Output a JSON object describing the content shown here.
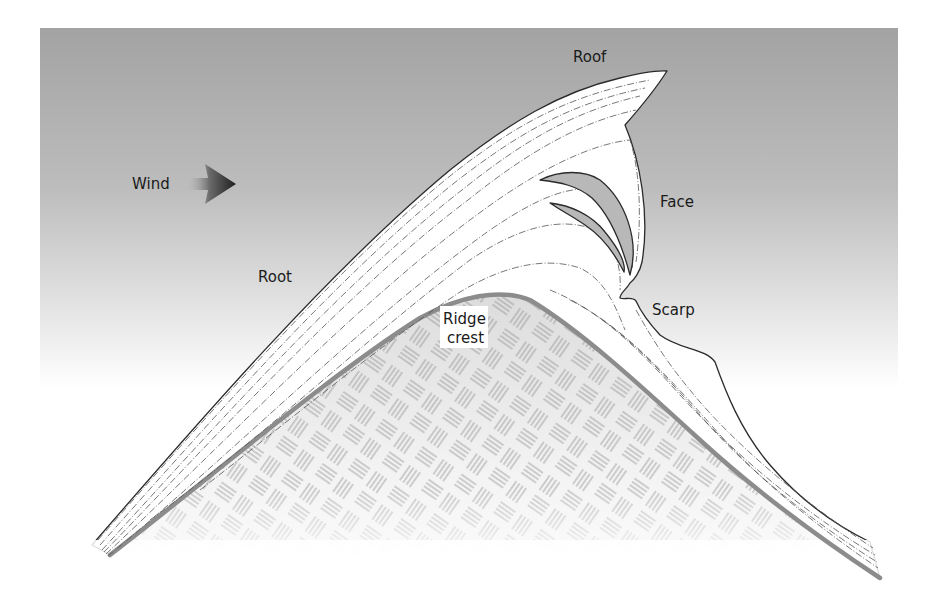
{
  "diagram": {
    "labels": {
      "roof": "Roof",
      "wind": "Wind",
      "face": "Face",
      "root": "Root",
      "scarp": "Scarp",
      "ridge_crest_line1": "Ridge",
      "ridge_crest_line2": "crest"
    },
    "colors": {
      "sky_top": "#a6a6a6",
      "sky_bottom": "#ffffff",
      "snow_fill": "#ffffff",
      "outline": "#2a2a2a",
      "ridge_stroke": "#8c8c8c",
      "rock_hatch": "#9a9a9a",
      "cavity_fill": "#b8b8b8",
      "layer_lines": "#555555",
      "wind_arrow": "#333333"
    },
    "elements": [
      {
        "name": "wind-arrow",
        "direction": "right"
      },
      {
        "name": "cornice-snow-body"
      },
      {
        "name": "cornice-cavities",
        "count": 2
      },
      {
        "name": "ridge-rock"
      }
    ]
  }
}
